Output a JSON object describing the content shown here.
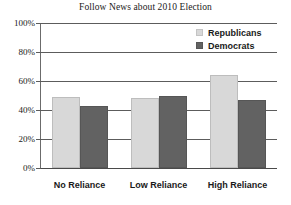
{
  "chart_data": {
    "type": "bar",
    "title": "Follow News about 2010 Election",
    "xlabel": "",
    "ylabel": "",
    "categories": [
      "No Reliance",
      "Low Reliance",
      "High Reliance"
    ],
    "series": [
      {
        "name": "Republicans",
        "color": "#d8d8d8",
        "values": [
          49,
          48,
          64
        ]
      },
      {
        "name": "Democrats",
        "color": "#626262",
        "values": [
          43,
          50,
          47
        ]
      }
    ],
    "ylim": [
      0,
      100
    ],
    "ytick_values": [
      100,
      80,
      60,
      40,
      20,
      0
    ],
    "ytick_labels": [
      "100%",
      "80%",
      "60%",
      "40%",
      "20%",
      "0%"
    ],
    "grid": true,
    "grid_axis": "y",
    "legend_position": "top-right",
    "legend_entries": [
      "Republicans",
      "Democrats"
    ],
    "value_format": "percent",
    "bar_group_gap": true
  },
  "axis": {
    "y_ticks": [
      {
        "label": "100%",
        "value": 100
      },
      {
        "label": "80%",
        "value": 80
      },
      {
        "label": "60%",
        "value": 60
      },
      {
        "label": "40%",
        "value": 40
      },
      {
        "label": "20%",
        "value": 20
      },
      {
        "label": "0%",
        "value": 0
      }
    ]
  },
  "legend": {
    "items": [
      {
        "label": "Republicans",
        "swatch": "rep"
      },
      {
        "label": "Democrats",
        "swatch": "dem"
      }
    ]
  },
  "colors": {
    "republicans": "#d8d8d8",
    "democrats": "#626262",
    "gridline": "#5c5c5c",
    "text": "#1a1a1a",
    "background": "#ffffff"
  }
}
